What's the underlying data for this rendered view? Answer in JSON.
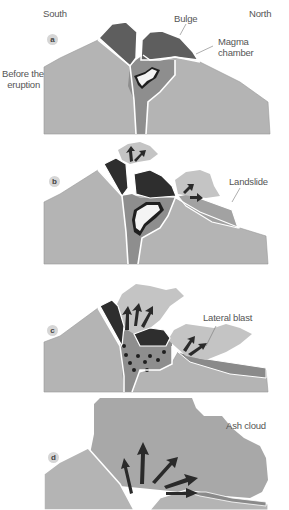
{
  "header": {
    "south_label": "South",
    "north_label": "North"
  },
  "panels": [
    {
      "id": "a",
      "marker": "a",
      "side_label_line1": "Before the",
      "side_label_line2": "eruption",
      "callouts": [
        {
          "name": "bulge",
          "text": "Bulge"
        },
        {
          "name": "magma-chamber",
          "line1": "Magma",
          "line2": "chamber"
        }
      ]
    },
    {
      "id": "b",
      "marker": "b",
      "callouts": [
        {
          "name": "landslide",
          "text": "Landslide"
        }
      ]
    },
    {
      "id": "c",
      "marker": "c",
      "callouts": [
        {
          "name": "lateral-blast",
          "text": "Lateral blast"
        }
      ]
    },
    {
      "id": "d",
      "marker": "d",
      "callouts": [
        {
          "name": "ash-cloud",
          "text": "Ash cloud"
        }
      ]
    }
  ],
  "colors": {
    "background": "#ffffff",
    "mountain": "#b4b4b4",
    "mountain_dark_edge": "#8a8a8a",
    "conduit": "#8e8e8e",
    "bulge": "#5e5e5e",
    "dark_rock": "#2e2e2e",
    "magma_white": "#f4f4f4",
    "cloud": "#c4c4c4",
    "ash_cloud": "#a8a8a8",
    "arrow": "#2a2a2a",
    "outline": "#ffffff",
    "text": "#555555"
  }
}
